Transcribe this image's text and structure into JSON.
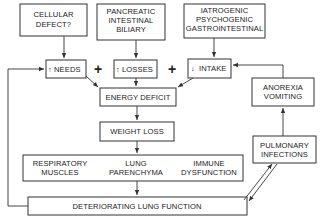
{
  "diagram": {
    "causes": {
      "cellular": [
        "CELLULAR",
        "DEFECT?"
      ],
      "pancreatic": [
        "PANCREATIC",
        "INTESTINAL",
        "BILIARY"
      ],
      "iatrogenic": [
        "IATROGENIC",
        "PSYCHOGENIC",
        "GASTROINTESTINAL"
      ]
    },
    "factors": {
      "needs": "NEEDS",
      "losses": "LOSSES",
      "intake": "INTAKE",
      "needs_arrow": "↑",
      "losses_arrow": "↑",
      "intake_arrow": "↓",
      "plus": "+"
    },
    "energy_deficit": "ENERGY DEFICIT",
    "weight_loss": "WEIGHT LOSS",
    "effects": {
      "respiratory": [
        "RESPIRATORY",
        "MUSCLES"
      ],
      "lung": [
        "LUNG",
        "PARENCHYMA"
      ],
      "immune": [
        "IMMUNE",
        "DYSFUNCTION"
      ]
    },
    "deteriorating": "DETERIORATING LUNG FUNCTION",
    "anorexia": [
      "ANOREXIA",
      "VOMITING"
    ],
    "pulmonary": [
      "PULMONARY",
      "INFECTIONS"
    ]
  }
}
